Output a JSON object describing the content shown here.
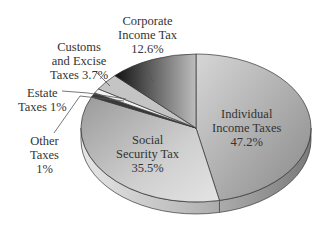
{
  "chart_data": {
    "type": "pie",
    "style": "3d",
    "title": "",
    "slices": [
      {
        "label": "Individual Income Taxes",
        "value": 47.2
      },
      {
        "label": "Social Security Tax",
        "value": 35.5
      },
      {
        "label": "Other Taxes",
        "value": 1
      },
      {
        "label": "Estate Taxes",
        "value": 1
      },
      {
        "label": "Customs and Excise Taxes",
        "value": 3.7
      },
      {
        "label": "Corporate Income Tax",
        "value": 12.6
      }
    ],
    "legend": "none (direct labels)"
  },
  "labels": {
    "corporate": {
      "line1": "Corporate",
      "line2": "Income Tax",
      "line3": "12.6%"
    },
    "customs": {
      "line1": "Customs",
      "line2": "and Excise",
      "line3": "Taxes 3.7%"
    },
    "estate": {
      "line1": "Estate",
      "line2": "Taxes 1%"
    },
    "other": {
      "line1": "Other",
      "line2": "Taxes",
      "line3": "1%"
    },
    "social": {
      "line1": "Social",
      "line2": "Security Tax",
      "line3": "35.5%"
    },
    "individual": {
      "line1": "Individual",
      "line2": "Income Taxes",
      "line3": "47.2%"
    }
  }
}
